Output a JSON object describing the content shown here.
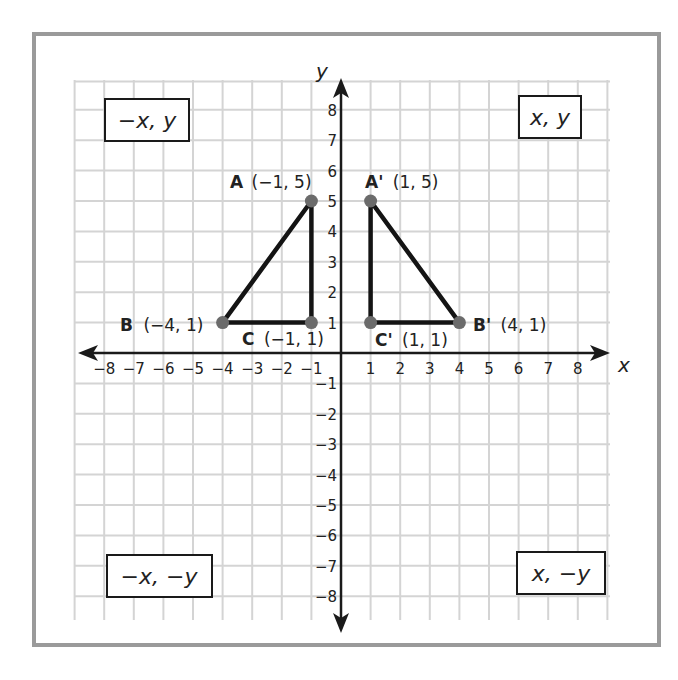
{
  "colors": {
    "frame": "#9a9a9a",
    "grid": "#d4d4d4",
    "axis": "#1a1a1a",
    "triangle": "#141414",
    "point": "#6b6b6b",
    "text": "#222222"
  },
  "axes": {
    "x_label": "x",
    "y_label": "y",
    "x_ticks": [
      "−8",
      "−7",
      "−6",
      "−5",
      "−4",
      "−3",
      "−2",
      "−1",
      "1",
      "2",
      "3",
      "4",
      "5",
      "6",
      "7",
      "8"
    ],
    "y_ticks": [
      "8",
      "7",
      "6",
      "5",
      "4",
      "3",
      "2",
      "1",
      "−1",
      "−2",
      "−3",
      "−4",
      "−5",
      "−6",
      "−7",
      "−8"
    ]
  },
  "quadrant_labels": {
    "q1": "x, y",
    "q2": "−x, y",
    "q3": "−x, −y",
    "q4": "x, −y"
  },
  "points": {
    "A": {
      "name": "A",
      "coords": "(−1, 5)",
      "x": -1,
      "y": 5
    },
    "B": {
      "name": "B",
      "coords": "(−4, 1)",
      "x": -4,
      "y": 1
    },
    "C": {
      "name": "C",
      "coords": "(−1, 1)",
      "x": -1,
      "y": 1
    },
    "A_prime": {
      "name": "A'",
      "coords": "(1, 5)",
      "x": 1,
      "y": 5
    },
    "B_prime": {
      "name": "B'",
      "coords": "(4, 1)",
      "x": 4,
      "y": 1
    },
    "C_prime": {
      "name": "C'",
      "coords": "(1, 1)",
      "x": 1,
      "y": 1
    }
  },
  "chart_data": {
    "type": "scatter",
    "title": "",
    "xlabel": "x",
    "ylabel": "y",
    "xlim": [
      -8,
      8
    ],
    "ylim": [
      -8,
      8
    ],
    "grid": true,
    "series": [
      {
        "name": "Triangle ABC",
        "closed": true,
        "points": [
          {
            "label": "A (−1, 5)",
            "x": -1,
            "y": 5
          },
          {
            "label": "B (−4, 1)",
            "x": -4,
            "y": 1
          },
          {
            "label": "C (−1, 1)",
            "x": -1,
            "y": 1
          }
        ]
      },
      {
        "name": "Triangle A'B'C' (reflection across y-axis)",
        "closed": true,
        "points": [
          {
            "label": "A' (1, 5)",
            "x": 1,
            "y": 5
          },
          {
            "label": "B' (4, 1)",
            "x": 4,
            "y": 1
          },
          {
            "label": "C' (1, 1)",
            "x": 1,
            "y": 1
          }
        ]
      }
    ],
    "annotations": [
      "x, y",
      "−x, y",
      "−x, −y",
      "x, −y"
    ]
  }
}
